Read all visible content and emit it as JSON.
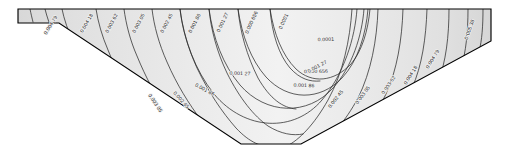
{
  "figure": {
    "type": "contour-plot",
    "domain_outline": "trapezoid with flat top edge, short vertical sides and sloping flanks meeting a narrow flat base",
    "fill_color": "#e4e4e4",
    "contour_color": "#2b2b2b",
    "border_color": "#000000",
    "background_color": "#ffffff",
    "label_color": "#1c1c1c"
  },
  "chart_data": {
    "type": "contour",
    "title": "",
    "xlabel": "",
    "ylabel": "",
    "grid": false,
    "legend": "none",
    "units": "",
    "level_count": 10,
    "levels": [
      0.0001,
      0.000656,
      0.00127,
      0.00186,
      0.00245,
      0.00305,
      0.00362,
      0.00418,
      0.00479,
      0.00538
    ],
    "level_labels": [
      "0.0001",
      "0.000 656",
      "0.001 27",
      "0.001 86",
      "0.002 45",
      "0.003 05",
      "0.003 62",
      "0.004 18",
      "0.004 79",
      "0.005 38"
    ],
    "zmin": 0.0001,
    "zmax": 0.00538,
    "symmetry": "bilateral about vertical centreline",
    "minimum_location": "top centre",
    "maximum_location": "upper left and upper right corners",
    "labels": [
      {
        "text": "0.004 79",
        "x": 52,
        "y": 26,
        "rot": -58
      },
      {
        "text": "0.004 18",
        "x": 88,
        "y": 24,
        "rot": -60
      },
      {
        "text": "0.003 62",
        "x": 113,
        "y": 24,
        "rot": -62
      },
      {
        "text": "0.003 05",
        "x": 140,
        "y": 24,
        "rot": -62
      },
      {
        "text": "0.002 45",
        "x": 168,
        "y": 24,
        "rot": -62
      },
      {
        "text": "0.001 86",
        "x": 196,
        "y": 24,
        "rot": -63
      },
      {
        "text": "0.001 27",
        "x": 224,
        "y": 23,
        "rot": -64
      },
      {
        "text": "0.000 656",
        "x": 253,
        "y": 23,
        "rot": -65
      },
      {
        "text": "0.0001",
        "x": 285,
        "y": 22,
        "rot": -66
      },
      {
        "text": "0.0001",
        "x": 326,
        "y": 41,
        "rot": -2
      },
      {
        "text": "0.000 656",
        "x": 316,
        "y": 73,
        "rot": -1
      },
      {
        "text": "0.001 27",
        "x": 240,
        "y": 75,
        "rot": 2
      },
      {
        "text": "0.001 27",
        "x": 318,
        "y": 68,
        "rot": -28
      },
      {
        "text": "0.001 86",
        "x": 304,
        "y": 87,
        "rot": 2
      },
      {
        "text": "0.001 86",
        "x": 204,
        "y": 91,
        "rot": 28
      },
      {
        "text": "0.002 45",
        "x": 180,
        "y": 101,
        "rot": 48
      },
      {
        "text": "0.003 05",
        "x": 154,
        "y": 104,
        "rot": 56
      },
      {
        "text": "0.002 45",
        "x": 337,
        "y": 100,
        "rot": -52
      },
      {
        "text": "0.003 05",
        "x": 364,
        "y": 96,
        "rot": -54
      },
      {
        "text": "0.003 62",
        "x": 390,
        "y": 86,
        "rot": -56
      },
      {
        "text": "0.004 18",
        "x": 412,
        "y": 76,
        "rot": -58
      },
      {
        "text": "0.004 79",
        "x": 434,
        "y": 60,
        "rot": -58
      },
      {
        "text": "0.005 38",
        "x": 471,
        "y": 30,
        "rot": -70
      }
    ]
  }
}
